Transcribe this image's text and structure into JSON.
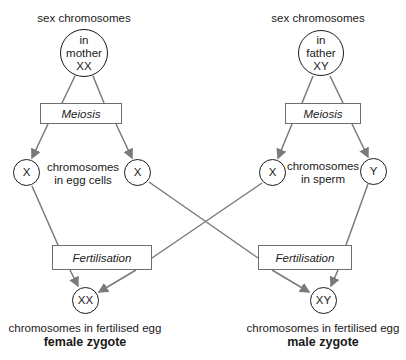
{
  "diagram": {
    "left": {
      "parent_label": "sex chromosomes",
      "parent_circle": {
        "line1": "in",
        "line2": "mother",
        "line3": "XX"
      },
      "meiosis_label": "Meiosis",
      "gamete_left": "X",
      "gamete_right": "X",
      "gamete_caption_line1": "chromosomes",
      "gamete_caption_line2": "in egg cells",
      "fertilisation_label": "Fertilisation",
      "zygote": "XX",
      "zygote_caption": "chromosomes in fertilised egg",
      "zygote_type": "female zygote"
    },
    "right": {
      "parent_label": "sex chromosomes",
      "parent_circle": {
        "line1": "in",
        "line2": "father",
        "line3": "XY"
      },
      "meiosis_label": "Meiosis",
      "gamete_left": "X",
      "gamete_right": "Y",
      "gamete_caption_line1": "chromosomes",
      "gamete_caption_line2": "in sperm",
      "fertilisation_label": "Fertilisation",
      "zygote": "XY",
      "zygote_caption": "chromosomes in fertilised egg",
      "zygote_type": "male zygote"
    },
    "colors": {
      "line": "#7a7a7a",
      "text": "#1a1a1a",
      "box_border": "#6e6e6e"
    }
  }
}
